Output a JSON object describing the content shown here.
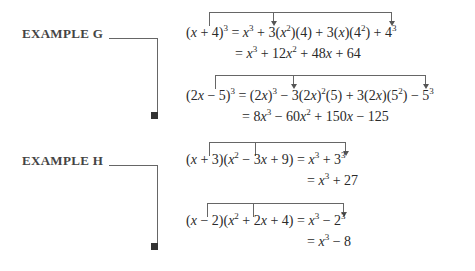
{
  "examples": [
    {
      "label": "EXAMPLE G",
      "problems": [
        {
          "lhs": "(x + 4)³",
          "expansion": "= x³ + 3(x²)(4) + 3(x)(4²) + 4³",
          "result": "= x³ + 12x² + 48x + 64"
        },
        {
          "lhs": "(2x − 5)³",
          "expansion": "= (2x)³ − 3(2x)²(5) + 3(2x)(5²) − 5³",
          "result": "= 8x³ − 60x² + 150x − 125"
        }
      ]
    },
    {
      "label": "EXAMPLE H",
      "problems": [
        {
          "lhs": "(x + 3)(x² − 3x + 9)",
          "expansion": "= x³ + 3³",
          "result": "= x³ + 27"
        },
        {
          "lhs": "(x − 2)(x² + 2x + 4)",
          "expansion": "= x³ − 2³",
          "result": "= x³ − 8"
        }
      ]
    }
  ],
  "icons": {
    "end_marker": "black-square"
  }
}
